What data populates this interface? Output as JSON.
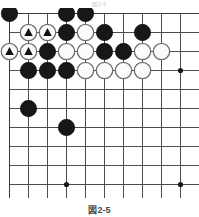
{
  "figure": {
    "type": "go-board-diagram",
    "top_caption": "図2-5",
    "bottom_caption": "図2-5",
    "board": {
      "columns": 10,
      "rows": 10,
      "cell_size": 19,
      "origin_x": 9,
      "origin_y": 5,
      "edges_shown": [
        "top",
        "left"
      ],
      "line_color": "#4d4d4d",
      "background_color": "#ffffff"
    },
    "star_points": [
      {
        "col": 9,
        "row": 3
      },
      {
        "col": 3,
        "row": 9
      },
      {
        "col": 9,
        "row": 9
      }
    ],
    "stones": [
      {
        "col": 0,
        "row": 0,
        "color": "black",
        "mark": "none"
      },
      {
        "col": 3,
        "row": 0,
        "color": "black",
        "mark": "none"
      },
      {
        "col": 4,
        "row": 0,
        "color": "black",
        "mark": "none"
      },
      {
        "col": 1,
        "row": 1,
        "color": "white",
        "mark": "triangle"
      },
      {
        "col": 2,
        "row": 1,
        "color": "white",
        "mark": "triangle"
      },
      {
        "col": 3,
        "row": 1,
        "color": "black",
        "mark": "none"
      },
      {
        "col": 4,
        "row": 1,
        "color": "white",
        "mark": "none"
      },
      {
        "col": 5,
        "row": 1,
        "color": "black",
        "mark": "none"
      },
      {
        "col": 7,
        "row": 1,
        "color": "black",
        "mark": "none"
      },
      {
        "col": 0,
        "row": 2,
        "color": "white",
        "mark": "triangle"
      },
      {
        "col": 1,
        "row": 2,
        "color": "white",
        "mark": "triangle"
      },
      {
        "col": 2,
        "row": 2,
        "color": "black",
        "mark": "none"
      },
      {
        "col": 3,
        "row": 2,
        "color": "white",
        "mark": "none"
      },
      {
        "col": 4,
        "row": 2,
        "color": "white",
        "mark": "none"
      },
      {
        "col": 5,
        "row": 2,
        "color": "black",
        "mark": "none"
      },
      {
        "col": 6,
        "row": 2,
        "color": "black",
        "mark": "none"
      },
      {
        "col": 7,
        "row": 2,
        "color": "white",
        "mark": "none"
      },
      {
        "col": 8,
        "row": 2,
        "color": "white",
        "mark": "none"
      },
      {
        "col": 1,
        "row": 3,
        "color": "black",
        "mark": "none"
      },
      {
        "col": 2,
        "row": 3,
        "color": "black",
        "mark": "none"
      },
      {
        "col": 3,
        "row": 3,
        "color": "black",
        "mark": "none"
      },
      {
        "col": 4,
        "row": 3,
        "color": "white",
        "mark": "none"
      },
      {
        "col": 5,
        "row": 3,
        "color": "white",
        "mark": "none"
      },
      {
        "col": 6,
        "row": 3,
        "color": "white",
        "mark": "none"
      },
      {
        "col": 7,
        "row": 3,
        "color": "white",
        "mark": "none"
      },
      {
        "col": 1,
        "row": 5,
        "color": "black",
        "mark": "none"
      },
      {
        "col": 3,
        "row": 6,
        "color": "black",
        "mark": "none"
      }
    ],
    "counts": {
      "black_stones": 15,
      "white_stones": 13,
      "marked_stones": 4
    }
  }
}
